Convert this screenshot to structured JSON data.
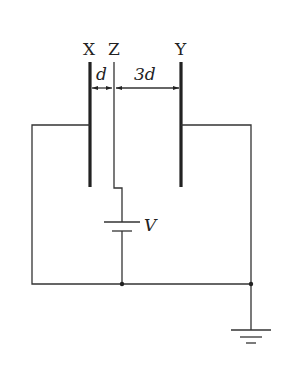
{
  "diagram": {
    "type": "circuit",
    "labels": {
      "plate_x": "X",
      "plate_z": "Z",
      "plate_y": "Y",
      "gap_xz": "d",
      "gap_zy": "3d",
      "battery": "V"
    },
    "components": [
      {
        "id": "plate-x",
        "kind": "thick plate",
        "label": "X"
      },
      {
        "id": "plate-z",
        "kind": "thin plate",
        "label": "Z"
      },
      {
        "id": "plate-y",
        "kind": "thick plate",
        "label": "Y"
      },
      {
        "id": "battery",
        "kind": "cell",
        "label": "V"
      },
      {
        "id": "ground",
        "kind": "earth"
      }
    ],
    "colors": {
      "line": "#333333",
      "background": "#ffffff"
    }
  }
}
